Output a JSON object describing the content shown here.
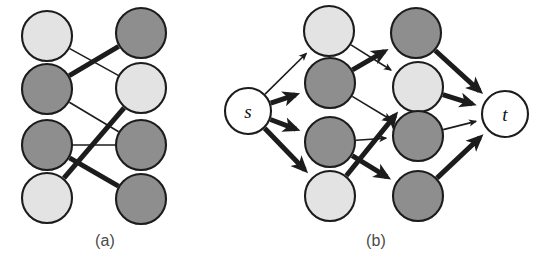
{
  "figure": {
    "width": 542,
    "height": 274,
    "background": "#ffffff",
    "style": {
      "node_light_fill": "#e3e3e3",
      "node_dark_fill": "#8e8e8e",
      "node_white_fill": "#ffffff",
      "node_stroke": "#1c1c1c",
      "edge_color": "#1c1c1c",
      "edge_thin_width": 1.6,
      "edge_thick_width": 5.0,
      "node_radius": 25,
      "terminal_radius": 23,
      "caption_color": "#4a4a4a"
    }
  },
  "panels": [
    {
      "id": "a",
      "caption": "(a)",
      "kind": "bipartite-matching",
      "directed": false,
      "nodes": [
        {
          "id": "aL1",
          "label": "",
          "shade": "light",
          "cx": 47,
          "cy": 36,
          "column": "left"
        },
        {
          "id": "aL2",
          "label": "",
          "shade": "dark",
          "cx": 47,
          "cy": 89,
          "column": "left"
        },
        {
          "id": "aL3",
          "label": "",
          "shade": "dark",
          "cx": 47,
          "cy": 145,
          "column": "left"
        },
        {
          "id": "aL4",
          "label": "",
          "shade": "light",
          "cx": 47,
          "cy": 198,
          "column": "left"
        },
        {
          "id": "aR1",
          "label": "",
          "shade": "dark",
          "cx": 141,
          "cy": 33,
          "column": "right"
        },
        {
          "id": "aR2",
          "label": "",
          "shade": "light",
          "cx": 141,
          "cy": 88,
          "column": "right"
        },
        {
          "id": "aR3",
          "label": "",
          "shade": "dark",
          "cx": 141,
          "cy": 145,
          "column": "right"
        },
        {
          "id": "aR4",
          "label": "",
          "shade": "dark",
          "cx": 141,
          "cy": 199,
          "column": "right"
        }
      ],
      "edges": [
        {
          "from": "aL1",
          "to": "aR2",
          "weight": "thin"
        },
        {
          "from": "aL2",
          "to": "aR1",
          "weight": "thick"
        },
        {
          "from": "aL2",
          "to": "aR3",
          "weight": "thin"
        },
        {
          "from": "aL3",
          "to": "aR3",
          "weight": "thin"
        },
        {
          "from": "aL3",
          "to": "aR4",
          "weight": "thick"
        },
        {
          "from": "aL4",
          "to": "aR2",
          "weight": "thick"
        }
      ]
    },
    {
      "id": "b",
      "caption": "(b)",
      "kind": "flow-network",
      "directed": true,
      "nodes": [
        {
          "id": "bs",
          "label": "s",
          "shade": "white",
          "cx": 38,
          "cy": 111,
          "column": "source"
        },
        {
          "id": "bL1",
          "label": "",
          "shade": "light",
          "cx": 119,
          "cy": 31,
          "column": "left"
        },
        {
          "id": "bL2",
          "label": "",
          "shade": "dark",
          "cx": 120,
          "cy": 83,
          "column": "left"
        },
        {
          "id": "bL3",
          "label": "",
          "shade": "dark",
          "cx": 120,
          "cy": 142,
          "column": "left"
        },
        {
          "id": "bL4",
          "label": "",
          "shade": "light",
          "cx": 120,
          "cy": 196,
          "column": "left"
        },
        {
          "id": "bR1",
          "label": "",
          "shade": "dark",
          "cx": 206,
          "cy": 33,
          "column": "right"
        },
        {
          "id": "bR2",
          "label": "",
          "shade": "light",
          "cx": 208,
          "cy": 87,
          "column": "right"
        },
        {
          "id": "bR3",
          "label": "",
          "shade": "dark",
          "cx": 208,
          "cy": 136,
          "column": "right"
        },
        {
          "id": "bR4",
          "label": "",
          "shade": "dark",
          "cx": 208,
          "cy": 196,
          "column": "right"
        },
        {
          "id": "bt",
          "label": "t",
          "shade": "white",
          "cx": 295,
          "cy": 114,
          "column": "sink"
        }
      ],
      "edges": [
        {
          "from": "bs",
          "to": "bL1",
          "weight": "thin"
        },
        {
          "from": "bs",
          "to": "bL2",
          "weight": "thick"
        },
        {
          "from": "bs",
          "to": "bL3",
          "weight": "thick"
        },
        {
          "from": "bs",
          "to": "bL4",
          "weight": "thick"
        },
        {
          "from": "bL1",
          "to": "bR2",
          "weight": "thin"
        },
        {
          "from": "bL2",
          "to": "bR1",
          "weight": "thick"
        },
        {
          "from": "bL2",
          "to": "bR3",
          "weight": "thin"
        },
        {
          "from": "bL3",
          "to": "bR3",
          "weight": "thin"
        },
        {
          "from": "bL3",
          "to": "bR4",
          "weight": "thick"
        },
        {
          "from": "bL4",
          "to": "bR2",
          "weight": "thick"
        },
        {
          "from": "bR1",
          "to": "bt",
          "weight": "thick"
        },
        {
          "from": "bR2",
          "to": "bt",
          "weight": "thick"
        },
        {
          "from": "bR3",
          "to": "bt",
          "weight": "thin"
        },
        {
          "from": "bR4",
          "to": "bt",
          "weight": "thick"
        }
      ]
    }
  ]
}
